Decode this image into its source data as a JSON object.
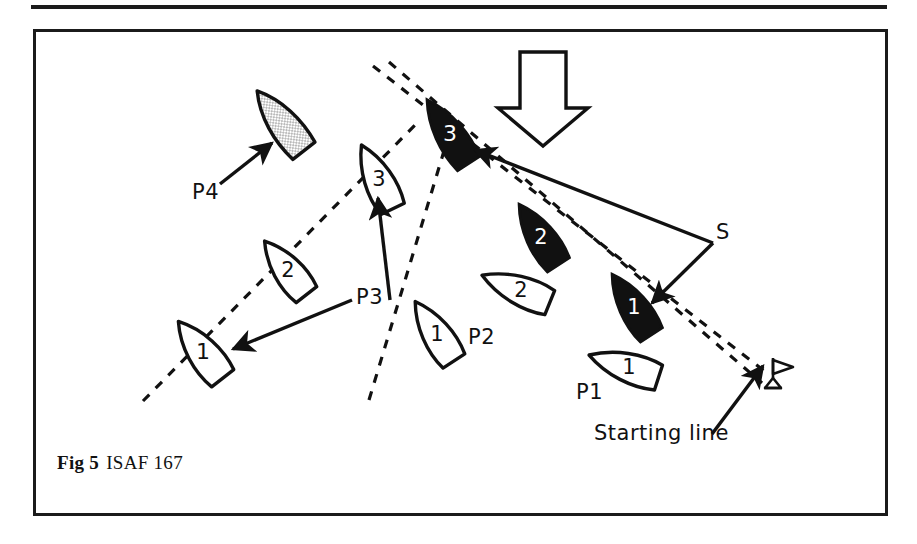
{
  "figure": {
    "caption_prefix": "Fig 5",
    "caption_text": "ISAF 167",
    "ink_color": "#111111",
    "frame_color": "#1b1b1b",
    "background_color": "#ffffff",
    "hull_fill_white": "#ffffff",
    "hull_fill_black": "#111111",
    "hull_fill_stipple": "#d8d8d8"
  },
  "labels": {
    "p1": "P1",
    "p2": "P2",
    "p3": "P3",
    "p4": "P4",
    "s": "S",
    "starting_line": "Starting line"
  },
  "wind_arrow": {
    "name": "wind-direction-arrow",
    "direction": "down"
  },
  "mark": {
    "name": "starting-line-mark-flag",
    "symbol": "flag-buoy"
  },
  "boats": [
    {
      "id": "p4-1",
      "track": "P4",
      "number": "",
      "fill": "stipple",
      "x": 283,
      "y": 124,
      "rotation": -38
    },
    {
      "id": "p3-1",
      "track": "P3",
      "number": "1",
      "fill": "white",
      "x": 203,
      "y": 353,
      "rotation": -38
    },
    {
      "id": "p3-2",
      "track": "P3",
      "number": "2",
      "fill": "white",
      "x": 288,
      "y": 271,
      "rotation": -38
    },
    {
      "id": "p3-3",
      "track": "P3",
      "number": "3",
      "fill": "white",
      "x": 379,
      "y": 181,
      "rotation": -28
    },
    {
      "id": "p2-1",
      "track": "P2",
      "number": "1",
      "fill": "white",
      "x": 437,
      "y": 335,
      "rotation": -35
    },
    {
      "id": "p2-2",
      "track": "P2",
      "number": "2",
      "fill": "white",
      "x": 518,
      "y": 292,
      "rotation": -20
    },
    {
      "id": "p1-1",
      "track": "P1",
      "number": "1",
      "fill": "white",
      "x": 629,
      "y": 368,
      "rotation": -15
    },
    {
      "id": "s-1",
      "track": "S",
      "number": "1",
      "fill": "black",
      "x": 634,
      "y": 308,
      "rotation": -35
    },
    {
      "id": "s-2",
      "track": "S",
      "number": "2",
      "fill": "black",
      "x": 541,
      "y": 238,
      "rotation": -35
    },
    {
      "id": "s-3",
      "track": "S",
      "number": "3",
      "fill": "black",
      "x": 450,
      "y": 135,
      "rotation": -35
    }
  ],
  "tracks": [
    {
      "id": "track-p3",
      "style": "dashed",
      "x1": 143,
      "y1": 401,
      "x2": 420,
      "y2": 120
    },
    {
      "id": "track-p2",
      "style": "dashed",
      "x1": 369,
      "y1": 400,
      "x2": 448,
      "y2": 131
    },
    {
      "id": "track-s",
      "style": "dashed",
      "x1": 373,
      "y1": 66,
      "x2": 770,
      "y2": 378
    }
  ],
  "leaders": [
    {
      "id": "leader-p4",
      "from_label": "P4",
      "x1": 222,
      "y1": 183,
      "x2": 272,
      "y2": 143
    },
    {
      "id": "leader-p3",
      "from_label": "P3",
      "x1": 356,
      "y1": 299,
      "x2": 228,
      "y2": 350
    },
    {
      "id": "leader-p3b",
      "from_label": "P3",
      "x1": 389,
      "y1": 298,
      "x2": 377,
      "y2": 196
    },
    {
      "id": "leader-s1",
      "from_label": "S",
      "x1": 714,
      "y1": 243,
      "x2": 649,
      "y2": 304
    },
    {
      "id": "leader-s3",
      "from_label": "S",
      "x1": 714,
      "y1": 243,
      "x2": 472,
      "y2": 152
    },
    {
      "id": "leader-starting-line",
      "from_label": "Starting line",
      "x1": 716,
      "y1": 431,
      "x2": 760,
      "y2": 368
    }
  ],
  "label_positions": {
    "p4": {
      "x": 192,
      "y": 182
    },
    "p3": {
      "x": 356,
      "y": 287
    },
    "p2": {
      "x": 470,
      "y": 327
    },
    "p1": {
      "x": 578,
      "y": 382
    },
    "s": {
      "x": 716,
      "y": 222
    },
    "starting_line": {
      "x": 596,
      "y": 423
    }
  }
}
